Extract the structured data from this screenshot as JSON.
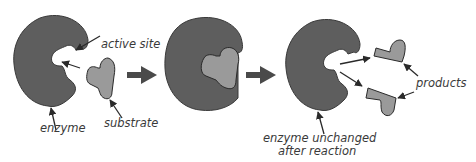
{
  "diagram": {
    "colors": {
      "enzyme": "#5e5e5e",
      "substrate": "#9a9a9a",
      "outline": "#2a2a2a",
      "arrow": "#4a4a4a",
      "label": "#3a3a3a",
      "background": "#ffffff"
    },
    "stages": [
      {
        "id": "before",
        "description": "Enzyme with empty active site and free substrate"
      },
      {
        "id": "complex",
        "description": "Enzyme-substrate complex"
      },
      {
        "id": "after",
        "description": "Enzyme unchanged, products released"
      }
    ],
    "labels": {
      "active_site": "active site",
      "substrate": "substrate",
      "enzyme": "enzyme",
      "enzyme_unchanged_line1": "enzyme unchanged",
      "enzyme_unchanged_line2": "after reaction",
      "products": "products"
    }
  }
}
